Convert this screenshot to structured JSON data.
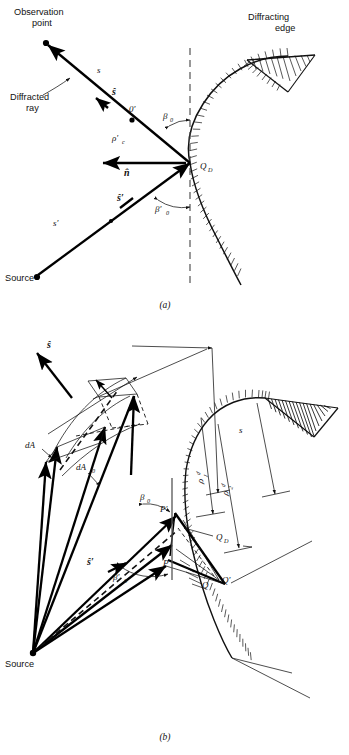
{
  "figure": {
    "captions": {
      "a": "(a)",
      "b": "(b)"
    }
  },
  "panel_a": {
    "labels": {
      "observation_point_line1": "Observation",
      "observation_point_line2": "point",
      "diffracted_ray_line1": "Diffracted",
      "diffracted_ray_line2": "ray",
      "diffracting_edge_line1": "Diffracting",
      "diffracting_edge_line2": "edge",
      "source": "Source",
      "s": "s",
      "s_prime": "s′",
      "s_hat": "ŝ",
      "s_hat_prime": "ŝ′",
      "o_prime": "0′",
      "rho_c_prime": "ρ′",
      "rho_c_prime_sub": "c",
      "n_hat": "n̂",
      "beta_0": "β",
      "beta_0_sub": "0",
      "beta_0_prime": "β′",
      "beta_0_prime_sub": "0",
      "q_d": "Q",
      "q_d_sub": "D"
    }
  },
  "panel_b": {
    "labels": {
      "source": "Source",
      "s_hat": "ŝ",
      "s_hat_prime": "ŝ′",
      "dA": "dA",
      "dA0": "dA",
      "dA0_sub": "0",
      "beta_0": "β",
      "beta_0_sub": "0",
      "beta_0_prime": "β′",
      "beta_0_prime_sub": "0",
      "s": "s",
      "rho_1": "ρ",
      "rho_1_sub": "1",
      "rho_1_sup": "d",
      "rho_2": "ρ",
      "rho_2_sub": "2",
      "rho_2_sup": "d",
      "p_prime": "P′",
      "p": "P",
      "q_d": "Q",
      "q_d_sub": "D",
      "q": "Q",
      "q_prime": "Q′"
    }
  },
  "colors": {
    "ink": "#111111",
    "line": "#000000",
    "dashed": "#444444",
    "background": "#ffffff"
  }
}
